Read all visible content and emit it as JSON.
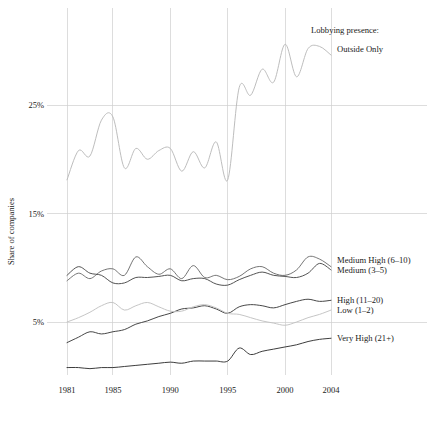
{
  "chart_data": {
    "type": "line",
    "title": "",
    "legend_title": "Lobbying presence:",
    "legend_position": "right-inline",
    "xlabel": "",
    "ylabel": "Share of companies",
    "xlim": [
      1981,
      2004
    ],
    "ylim": [
      0,
      32
    ],
    "grid": true,
    "y_ticks": [
      5,
      15,
      25
    ],
    "y_tick_labels": [
      "5%",
      "15%",
      "25%"
    ],
    "x_ticks": [
      1981,
      1985,
      1990,
      1995,
      2000,
      2004
    ],
    "x_tick_labels": [
      "1981",
      "1985",
      "1990",
      "1995",
      "2000",
      "2004"
    ],
    "x": [
      1981,
      1982,
      1983,
      1984,
      1985,
      1986,
      1987,
      1988,
      1989,
      1990,
      1991,
      1992,
      1993,
      1994,
      1995,
      1996,
      1997,
      1998,
      1999,
      2000,
      2001,
      2002,
      2003,
      2004
    ],
    "series": [
      {
        "name": "Outside Only",
        "color": "#b9b9b9",
        "label": "Outside Only",
        "label_value": 30.2,
        "values": [
          18.1,
          20.8,
          20.3,
          23.6,
          23.9,
          19.2,
          21.0,
          20.0,
          20.8,
          21.0,
          18.9,
          20.7,
          19.2,
          21.6,
          18.1,
          26.6,
          25.9,
          28.3,
          27.1,
          30.6,
          27.6,
          30.2,
          30.4,
          29.6
        ]
      },
      {
        "name": "Medium High (6-10)",
        "color": "#6e6e6e",
        "label": "Medium High (6–10)",
        "label_value": 10.7,
        "values": [
          8.8,
          9.5,
          9.0,
          9.7,
          9.9,
          9.3,
          11.0,
          10.1,
          9.4,
          9.9,
          9.0,
          10.2,
          9.1,
          9.3,
          8.9,
          9.2,
          9.9,
          10.1,
          9.5,
          9.3,
          9.8,
          11.0,
          10.8,
          10.1
        ]
      },
      {
        "name": "Medium (3-5)",
        "color": "#4a4a4a",
        "label": "Medium (3–5)",
        "label_value": 9.8,
        "values": [
          9.3,
          10.1,
          9.5,
          9.3,
          8.6,
          8.6,
          9.1,
          9.1,
          9.2,
          9.3,
          8.8,
          9.0,
          9.0,
          8.5,
          8.4,
          8.9,
          9.3,
          9.6,
          9.3,
          9.2,
          9.1,
          9.5,
          10.4,
          9.8
        ]
      },
      {
        "name": "High (11-20)",
        "color": "#3d3d3d",
        "label": "High (11–20)",
        "label_value": 7.0,
        "values": [
          3.1,
          3.6,
          4.1,
          3.9,
          4.1,
          4.3,
          4.8,
          5.1,
          5.5,
          5.8,
          6.2,
          6.3,
          6.5,
          6.2,
          5.8,
          6.4,
          6.6,
          6.5,
          6.3,
          6.6,
          6.9,
          7.1,
          6.9,
          7.0
        ]
      },
      {
        "name": "Low (1-2)",
        "color": "#c2c2c2",
        "label": "Low (1–2)",
        "label_value": 6.1,
        "values": [
          5.0,
          5.4,
          5.9,
          6.5,
          6.8,
          6.1,
          6.5,
          6.8,
          6.4,
          6.0,
          6.0,
          6.4,
          6.6,
          6.3,
          5.8,
          5.7,
          5.4,
          5.1,
          4.9,
          4.7,
          5.0,
          5.4,
          5.7,
          6.1
        ]
      },
      {
        "name": "Very High (21+)",
        "color": "#333333",
        "label": "Very High (21+)",
        "label_value": 3.5,
        "values": [
          0.8,
          0.8,
          0.7,
          0.8,
          0.8,
          0.9,
          1.0,
          1.1,
          1.2,
          1.3,
          1.2,
          1.4,
          1.4,
          1.4,
          1.4,
          2.6,
          2.0,
          2.3,
          2.5,
          2.7,
          2.9,
          3.2,
          3.4,
          3.5
        ]
      }
    ]
  },
  "axis": {
    "y_label": "Share of companies"
  },
  "legend": {
    "title": "Lobbying presence:"
  },
  "colors": {
    "gridline": "#cfcfcf",
    "background": "#ffffff",
    "text": "#1a1a1a"
  }
}
